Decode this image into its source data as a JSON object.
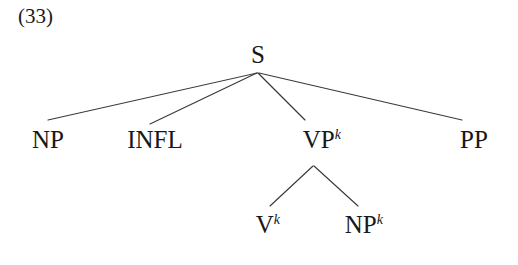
{
  "figure": {
    "example_number": "(33)",
    "type": "syntactic-tree",
    "line_color": "#3a3a3a",
    "text_color": "#181818",
    "background_color": "#ffffff"
  },
  "tree": {
    "root": {
      "id": "s",
      "label": "S",
      "superscript": ""
    },
    "level1": [
      {
        "id": "np",
        "label": "NP",
        "superscript": ""
      },
      {
        "id": "infl",
        "label": "INFL",
        "superscript": ""
      },
      {
        "id": "vp",
        "label": "VP",
        "superscript": "k"
      },
      {
        "id": "pp",
        "label": "PP",
        "superscript": ""
      }
    ],
    "level2": [
      {
        "id": "v",
        "label": "V",
        "superscript": "k"
      },
      {
        "id": "npk",
        "label": "NP",
        "superscript": "k"
      }
    ],
    "edges": [
      {
        "from": "s",
        "to": "np",
        "x1": 257,
        "y1": 73,
        "x2": 48,
        "y2": 120
      },
      {
        "from": "s",
        "to": "infl",
        "x1": 257,
        "y1": 73,
        "x2": 150,
        "y2": 124
      },
      {
        "from": "s",
        "to": "vp",
        "x1": 258,
        "y1": 73,
        "x2": 305,
        "y2": 120
      },
      {
        "from": "s",
        "to": "pp",
        "x1": 259,
        "y1": 73,
        "x2": 462,
        "y2": 120
      },
      {
        "from": "vp",
        "to": "v",
        "x1": 313,
        "y1": 166,
        "x2": 270,
        "y2": 206
      },
      {
        "from": "vp",
        "to": "npk",
        "x1": 314,
        "y1": 166,
        "x2": 358,
        "y2": 206
      }
    ]
  }
}
